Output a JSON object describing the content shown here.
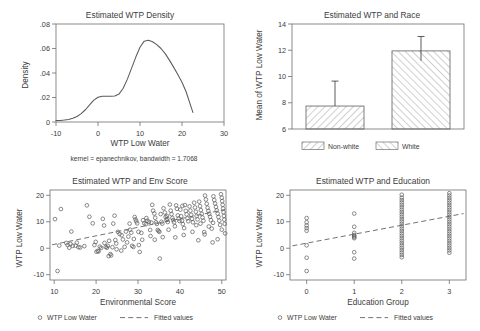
{
  "figure": {
    "panels": [
      "density",
      "race",
      "env",
      "edu"
    ]
  },
  "chart_data": [
    {
      "id": "density",
      "type": "line",
      "title": "Estimated WTP Density",
      "xlabel": "WTP Low Water",
      "ylabel": "Density",
      "note": "kernel = epanechnikov, bandwidth = 1.7068",
      "xlim": [
        -10,
        30
      ],
      "ylim": [
        0,
        0.08
      ],
      "xticks": [
        -10,
        0,
        10,
        20,
        30
      ],
      "xticklabels": [
        "-10",
        "0",
        "10",
        "20",
        "30"
      ],
      "yticks": [
        0,
        0.02,
        0.04,
        0.06,
        0.08
      ],
      "yticklabels": [
        "0",
        ".02",
        ".04",
        ".06",
        ".08"
      ],
      "grid": false,
      "legend": "none",
      "x": [
        -10.0,
        -9.0,
        -8.0,
        -7.0,
        -6.0,
        -5.0,
        -4.0,
        -3.0,
        -2.0,
        -1.0,
        0.0,
        1.0,
        2.0,
        3.0,
        4.0,
        5.0,
        6.0,
        7.0,
        8.0,
        9.0,
        10.0,
        11.0,
        12.0,
        13.0,
        14.0,
        15.0,
        16.0,
        17.0,
        18.0,
        19.0,
        20.0,
        21.0,
        22.0,
        22.6
      ],
      "y": [
        0.0012,
        0.0013,
        0.0016,
        0.0021,
        0.003,
        0.0045,
        0.0068,
        0.01,
        0.014,
        0.0178,
        0.0202,
        0.021,
        0.0211,
        0.021,
        0.0212,
        0.0228,
        0.0276,
        0.035,
        0.044,
        0.053,
        0.061,
        0.066,
        0.0667,
        0.0655,
        0.0632,
        0.06,
        0.0558,
        0.0505,
        0.0448,
        0.0388,
        0.0325,
        0.0245,
        0.014,
        0.0078
      ]
    },
    {
      "id": "race",
      "type": "bar",
      "title": "Estimated WTP and Race",
      "xlabel": "",
      "ylabel": "Mean of WTP Low Water",
      "categories": [
        "Non-white",
        "White"
      ],
      "values": [
        7.75,
        11.95
      ],
      "errors_low": [
        7.75,
        11.2
      ],
      "errors_high": [
        9.65,
        13.05
      ],
      "ylim": [
        6,
        14
      ],
      "yticks": [
        6,
        8,
        10,
        12,
        14
      ],
      "yticklabels": [
        "6",
        "8",
        "10",
        "12",
        "14"
      ],
      "grid": false,
      "legend": "bottom",
      "legend_entries": [
        "Non-white",
        "White"
      ]
    },
    {
      "id": "env",
      "type": "scatter",
      "title": "Estimated WTP and Env Score",
      "xlabel": "Environmental Score",
      "ylabel": "WTP Low Water",
      "xlim": [
        9,
        51
      ],
      "ylim": [
        -12,
        22
      ],
      "xticks": [
        10,
        20,
        30,
        40,
        50
      ],
      "xticklabels": [
        "10",
        "20",
        "30",
        "40",
        "50"
      ],
      "yticks": [
        -10,
        0,
        10,
        20
      ],
      "yticklabels": [
        "-10",
        "0",
        "10",
        "20"
      ],
      "grid": false,
      "legend": "bottom",
      "legend_entries": [
        "WTP Low Water",
        "Fitted values"
      ],
      "fit_line": {
        "x": [
          9.5,
          50.8
        ],
        "y": [
          1.3,
          14.6
        ]
      },
      "points": [
        [
          10.2,
          11.0
        ],
        [
          10.8,
          -8.6
        ],
        [
          11.6,
          14.8
        ],
        [
          13.2,
          1.2
        ],
        [
          13.6,
          0.2
        ],
        [
          13.9,
          1.6
        ],
        [
          14.1,
          6.3
        ],
        [
          14.4,
          0.9
        ],
        [
          15.1,
          1.0
        ],
        [
          15.8,
          0.4
        ],
        [
          16.2,
          0.3
        ],
        [
          17.8,
          16.2
        ],
        [
          18.4,
          11.9
        ],
        [
          19.2,
          9.4
        ],
        [
          19.6,
          1.2
        ],
        [
          20.1,
          -1.3
        ],
        [
          20.4,
          -1.0
        ],
        [
          20.6,
          -1.2
        ],
        [
          20.9,
          0.6
        ],
        [
          21.2,
          0.1
        ],
        [
          21.6,
          11.1
        ],
        [
          21.9,
          8.6
        ],
        [
          22.3,
          0.5
        ],
        [
          22.6,
          0.2
        ],
        [
          22.8,
          0.9
        ],
        [
          23.1,
          2.8
        ],
        [
          23.4,
          -2.2
        ],
        [
          23.6,
          -2.7
        ],
        [
          23.9,
          0.4
        ],
        [
          24.1,
          9.3
        ],
        [
          24.4,
          12.3
        ],
        [
          24.6,
          3.1
        ],
        [
          24.9,
          -0.4
        ],
        [
          25.2,
          6.2
        ],
        [
          25.6,
          5.4
        ],
        [
          26.1,
          4.9
        ],
        [
          26.4,
          3.3
        ],
        [
          26.8,
          0.5
        ],
        [
          27.1,
          6.3
        ],
        [
          27.4,
          2.2
        ],
        [
          27.7,
          4.4
        ],
        [
          28.1,
          7.0
        ],
        [
          28.4,
          5.9
        ],
        [
          28.6,
          0.9
        ],
        [
          28.9,
          0.5
        ],
        [
          29.2,
          11.8
        ],
        [
          29.4,
          10.9
        ],
        [
          29.6,
          10.2
        ],
        [
          29.8,
          9.4
        ],
        [
          30.1,
          6.2
        ],
        [
          30.4,
          -1.4
        ],
        [
          30.8,
          5.8
        ],
        [
          31.2,
          10.6
        ],
        [
          31.5,
          9.4
        ],
        [
          31.9,
          9.1
        ],
        [
          32.2,
          10.4
        ],
        [
          32.6,
          10.0
        ],
        [
          32.9,
          6.9
        ],
        [
          33.2,
          9.7
        ],
        [
          33.4,
          16.4
        ],
        [
          33.6,
          14.2
        ],
        [
          33.9,
          13.1
        ],
        [
          34.1,
          11.5
        ],
        [
          34.3,
          9.8
        ],
        [
          34.5,
          9.2
        ],
        [
          34.7,
          6.9
        ],
        [
          34.9,
          6.5
        ],
        [
          35.1,
          6.2
        ],
        [
          35.2,
          -3.9
        ],
        [
          35.4,
          12.9
        ],
        [
          35.6,
          10.0
        ],
        [
          35.8,
          9.3
        ],
        [
          36.1,
          15.1
        ],
        [
          36.4,
          13.5
        ],
        [
          36.6,
          11.8
        ],
        [
          36.8,
          10.7
        ],
        [
          37.1,
          9.9
        ],
        [
          37.3,
          7.0
        ],
        [
          37.6,
          16.5
        ],
        [
          37.8,
          14.2
        ],
        [
          38.0,
          12.9
        ],
        [
          38.2,
          11.4
        ],
        [
          38.4,
          10.6
        ],
        [
          38.6,
          9.8
        ],
        [
          38.8,
          8.3
        ],
        [
          39.1,
          16.2
        ],
        [
          39.3,
          14.9
        ],
        [
          39.5,
          12.4
        ],
        [
          39.7,
          11.2
        ],
        [
          39.9,
          10.3
        ],
        [
          40.1,
          14.6
        ],
        [
          40.3,
          12.1
        ],
        [
          40.5,
          10.4
        ],
        [
          40.7,
          9.1
        ],
        [
          40.9,
          5.0
        ],
        [
          41.2,
          16.3
        ],
        [
          41.4,
          14.1
        ],
        [
          41.6,
          12.8
        ],
        [
          41.8,
          11.3
        ],
        [
          42.0,
          10.2
        ],
        [
          42.3,
          15.8
        ],
        [
          42.5,
          14.2
        ],
        [
          42.7,
          12.6
        ],
        [
          42.9,
          11.1
        ],
        [
          43.1,
          9.8
        ],
        [
          43.4,
          17.2
        ],
        [
          43.6,
          15.4
        ],
        [
          43.8,
          13.8
        ],
        [
          44.0,
          12.2
        ],
        [
          44.2,
          10.9
        ],
        [
          44.4,
          3.0
        ],
        [
          44.6,
          17.6
        ],
        [
          44.8,
          15.9
        ],
        [
          45.0,
          14.4
        ],
        [
          45.2,
          13.0
        ],
        [
          45.4,
          11.6
        ],
        [
          45.6,
          10.4
        ],
        [
          45.8,
          6.1
        ],
        [
          46.0,
          19.9
        ],
        [
          46.2,
          18.4
        ],
        [
          46.4,
          16.8
        ],
        [
          46.6,
          15.3
        ],
        [
          46.8,
          14.1
        ],
        [
          47.0,
          13.0
        ],
        [
          47.2,
          11.9
        ],
        [
          47.4,
          10.6
        ],
        [
          47.6,
          7.4
        ],
        [
          47.8,
          2.2
        ],
        [
          48.0,
          19.6
        ],
        [
          48.2,
          18.2
        ],
        [
          48.4,
          16.9
        ],
        [
          48.6,
          15.6
        ],
        [
          48.8,
          14.3
        ],
        [
          49.0,
          13.1
        ],
        [
          49.2,
          11.8
        ],
        [
          49.4,
          10.4
        ],
        [
          49.6,
          8.8
        ],
        [
          49.8,
          20.4
        ],
        [
          50.0,
          19.1
        ],
        [
          50.1,
          17.8
        ],
        [
          50.2,
          16.4
        ],
        [
          50.3,
          15.0
        ],
        [
          50.4,
          13.6
        ],
        [
          50.5,
          12.2
        ],
        [
          50.6,
          10.8
        ],
        [
          50.7,
          9.2
        ],
        [
          50.8,
          5.6
        ],
        [
          34.0,
          3.2
        ],
        [
          30.2,
          1.2
        ],
        [
          26.0,
          -0.9
        ],
        [
          23.0,
          -3.0
        ],
        [
          35.9,
          4.2
        ],
        [
          41.0,
          7.6
        ],
        [
          43.0,
          6.2
        ],
        [
          45.9,
          5.2
        ],
        [
          49.0,
          3.4
        ],
        [
          38.9,
          4.1
        ],
        [
          33.0,
          4.6
        ],
        [
          31.0,
          3.2
        ],
        [
          29.0,
          3.5
        ],
        [
          24.8,
          1.8
        ],
        [
          22.0,
          2.0
        ],
        [
          19.9,
          2.4
        ],
        [
          17.2,
          0.8
        ],
        [
          15.4,
          2.1
        ],
        [
          12.9,
          2.0
        ],
        [
          11.2,
          1.0
        ],
        [
          28.0,
          9.3
        ],
        [
          36.9,
          12.2
        ],
        [
          40.6,
          16.0
        ],
        [
          44.9,
          9.3
        ],
        [
          47.9,
          9.6
        ],
        [
          50.0,
          7.0
        ],
        [
          46.9,
          8.2
        ],
        [
          43.9,
          8.7
        ],
        [
          37.0,
          11.1
        ],
        [
          32.0,
          11.4
        ]
      ]
    },
    {
      "id": "edu",
      "type": "scatter",
      "title": "Estimated WTP and Education",
      "xlabel": "Education Group",
      "ylabel": "WTP Low Water",
      "xlim": [
        -0.35,
        3.35
      ],
      "ylim": [
        -12,
        22
      ],
      "xticks": [
        0,
        1,
        2,
        3
      ],
      "xticklabels": [
        "0",
        "1",
        "2",
        "3"
      ],
      "yticks": [
        -10,
        0,
        10,
        20
      ],
      "yticklabels": [
        "-10",
        "0",
        "10",
        "20"
      ],
      "grid": false,
      "legend": "bottom",
      "legend_entries": [
        "WTP Low Water",
        "Fitted values"
      ],
      "fit_line": {
        "x": [
          -0.3,
          3.3
        ],
        "y": [
          0.9,
          13.1
        ]
      },
      "points": [
        [
          0,
          11.4
        ],
        [
          0,
          9.8
        ],
        [
          0,
          8.6
        ],
        [
          0,
          7.6
        ],
        [
          0,
          6.6
        ],
        [
          0,
          1.1
        ],
        [
          0,
          -3.6
        ],
        [
          0,
          -8.6
        ],
        [
          1,
          13.1
        ],
        [
          1,
          8.1
        ],
        [
          1,
          5.8
        ],
        [
          1,
          5.0
        ],
        [
          1,
          4.6
        ],
        [
          1,
          4.2
        ],
        [
          1,
          3.8
        ],
        [
          1,
          -1.5
        ],
        [
          1,
          -3.9
        ],
        [
          2,
          20.2
        ],
        [
          2,
          19.1
        ],
        [
          2,
          18.2
        ],
        [
          2,
          17.3
        ],
        [
          2,
          16.4
        ],
        [
          2,
          15.5
        ],
        [
          2,
          14.6
        ],
        [
          2,
          13.7
        ],
        [
          2,
          12.8
        ],
        [
          2,
          11.9
        ],
        [
          2,
          11.0
        ],
        [
          2,
          10.1
        ],
        [
          2,
          9.2
        ],
        [
          2,
          8.3
        ],
        [
          2,
          7.4
        ],
        [
          2,
          6.5
        ],
        [
          2,
          5.6
        ],
        [
          2,
          4.7
        ],
        [
          2,
          3.8
        ],
        [
          2,
          2.9
        ],
        [
          2,
          2.0
        ],
        [
          2,
          1.1
        ],
        [
          2,
          0.2
        ],
        [
          2,
          -0.7
        ],
        [
          2,
          -1.6
        ],
        [
          2,
          -2.5
        ],
        [
          2,
          -3.4
        ],
        [
          3,
          20.8
        ],
        [
          3,
          19.9
        ],
        [
          3,
          19.0
        ],
        [
          3,
          18.1
        ],
        [
          3,
          17.2
        ],
        [
          3,
          16.3
        ],
        [
          3,
          15.4
        ],
        [
          3,
          14.5
        ],
        [
          3,
          13.6
        ],
        [
          3,
          12.7
        ],
        [
          3,
          11.8
        ],
        [
          3,
          10.9
        ],
        [
          3,
          10.0
        ],
        [
          3,
          9.1
        ],
        [
          3,
          8.2
        ],
        [
          3,
          7.3
        ],
        [
          3,
          6.4
        ],
        [
          3,
          5.5
        ],
        [
          3,
          4.6
        ],
        [
          3,
          3.7
        ],
        [
          3,
          2.8
        ],
        [
          3,
          1.9
        ],
        [
          3,
          1.0
        ],
        [
          3,
          0.1
        ],
        [
          3,
          -0.8
        ],
        [
          3,
          -1.7
        ]
      ]
    }
  ]
}
